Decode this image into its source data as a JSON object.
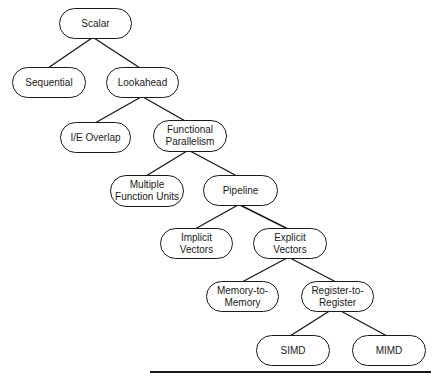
{
  "diagram": {
    "type": "tree",
    "nodes": [
      {
        "id": "scalar",
        "label": "Scalar"
      },
      {
        "id": "sequential",
        "label": "Sequential"
      },
      {
        "id": "lookahead",
        "label": "Lookahead"
      },
      {
        "id": "ie_overlap",
        "label": "I/E Overlap"
      },
      {
        "id": "functional_parallelism",
        "label": "Functional\nParallelism"
      },
      {
        "id": "multiple_function_units",
        "label": "Multiple\nFunction Units"
      },
      {
        "id": "pipeline",
        "label": "Pipeline"
      },
      {
        "id": "implicit_vectors",
        "label": "Implicit\nVectors"
      },
      {
        "id": "explicit_vectors",
        "label": "Explicit\nVectors"
      },
      {
        "id": "memory_to_memory",
        "label": "Memory-to-\nMemory"
      },
      {
        "id": "register_to_register",
        "label": "Register-to-\nRegister"
      },
      {
        "id": "simd",
        "label": "SIMD"
      },
      {
        "id": "mimd",
        "label": "MIMD"
      }
    ],
    "edges": [
      [
        "scalar",
        "sequential"
      ],
      [
        "scalar",
        "lookahead"
      ],
      [
        "lookahead",
        "ie_overlap"
      ],
      [
        "lookahead",
        "functional_parallelism"
      ],
      [
        "functional_parallelism",
        "multiple_function_units"
      ],
      [
        "functional_parallelism",
        "pipeline"
      ],
      [
        "pipeline",
        "implicit_vectors"
      ],
      [
        "pipeline",
        "explicit_vectors"
      ],
      [
        "explicit_vectors",
        "memory_to_memory"
      ],
      [
        "explicit_vectors",
        "register_to_register"
      ],
      [
        "register_to_register",
        "simd"
      ],
      [
        "register_to_register",
        "mimd"
      ]
    ],
    "colors": {
      "stroke": "#1a1a1a",
      "background": "#ffffff"
    }
  }
}
